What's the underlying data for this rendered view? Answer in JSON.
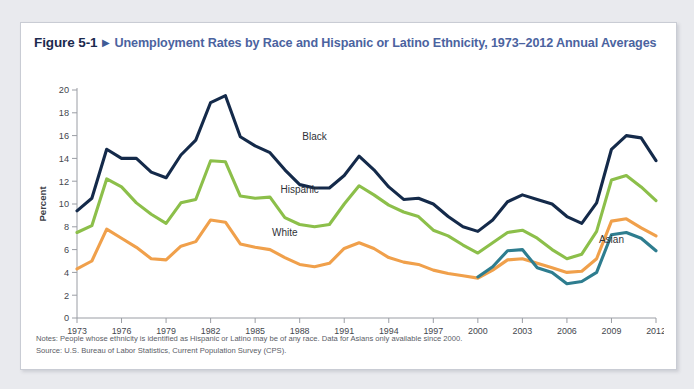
{
  "figure": {
    "number": "Figure 5-1",
    "arrow_icon": "triangle-right-icon",
    "title": "Unemployment Rates by Race and Hispanic or Latino Ethnicity, 1973–2012 Annual Averages"
  },
  "notes": {
    "note": "Notes: People whose ethnicity is identified as Hispanic or Latino may be of any race. Data for Asians only available since 2000.",
    "source": "Source: U.S. Bureau of Labor Statistics, Current Population Survey (CPS)."
  },
  "axis": {
    "ylabel": "Percent",
    "yticks": [
      "0",
      "2",
      "4",
      "6",
      "8",
      "10",
      "12",
      "14",
      "16",
      "18",
      "20"
    ],
    "xticks": [
      "1973",
      "1976",
      "1979",
      "1982",
      "1985",
      "1988",
      "1991",
      "1994",
      "1997",
      "2000",
      "2003",
      "2006",
      "2009",
      "2012"
    ]
  },
  "colors": {
    "black_series": "#142a4a",
    "hispanic_series": "#8cbf4a",
    "white_series": "#f0a04b",
    "asian_series": "#2e7d8f",
    "title_accent": "#4b63a0",
    "figure_number": "#1b2a4e",
    "axis": "#9a9da4",
    "card_bg": "#ffffff",
    "page_bg": "#e9eaee"
  },
  "chart_data": {
    "type": "line",
    "title": "Unemployment Rates by Race and Hispanic or Latino Ethnicity, 1973–2012 Annual Averages",
    "xlabel": "",
    "ylabel": "Percent",
    "xlim": [
      1973,
      2012
    ],
    "ylim": [
      0,
      20
    ],
    "grid": false,
    "legend": "inline-labels",
    "x": [
      1973,
      1974,
      1975,
      1976,
      1977,
      1978,
      1979,
      1980,
      1981,
      1982,
      1983,
      1984,
      1985,
      1986,
      1987,
      1988,
      1989,
      1990,
      1991,
      1992,
      1993,
      1994,
      1995,
      1996,
      1997,
      1998,
      1999,
      2000,
      2001,
      2002,
      2003,
      2004,
      2005,
      2006,
      2007,
      2008,
      2009,
      2010,
      2011,
      2012
    ],
    "series": [
      {
        "name": "Black",
        "color": "#142a4a",
        "label_x": 1989,
        "label_y": 15.6,
        "values": [
          9.4,
          10.5,
          14.8,
          14.0,
          14.0,
          12.8,
          12.3,
          14.3,
          15.6,
          18.9,
          19.5,
          15.9,
          15.1,
          14.5,
          13.0,
          11.7,
          11.4,
          11.4,
          12.5,
          14.2,
          13.0,
          11.5,
          10.4,
          10.5,
          10.0,
          8.9,
          8.0,
          7.6,
          8.6,
          10.2,
          10.8,
          10.4,
          10.0,
          8.9,
          8.3,
          10.1,
          14.8,
          16.0,
          15.8,
          13.8
        ]
      },
      {
        "name": "Hispanic",
        "color": "#8cbf4a",
        "label_x": 1988,
        "label_y": 11.0,
        "values": [
          7.5,
          8.1,
          12.2,
          11.5,
          10.1,
          9.1,
          8.3,
          10.1,
          10.4,
          13.8,
          13.7,
          10.7,
          10.5,
          10.6,
          8.8,
          8.2,
          8.0,
          8.2,
          10.0,
          11.6,
          10.8,
          9.9,
          9.3,
          8.9,
          7.7,
          7.2,
          6.4,
          5.7,
          6.6,
          7.5,
          7.7,
          7.0,
          6.0,
          5.2,
          5.6,
          7.6,
          12.1,
          12.5,
          11.5,
          10.3
        ]
      },
      {
        "name": "White",
        "color": "#f0a04b",
        "label_x": 1987,
        "label_y": 7.2,
        "values": [
          4.3,
          5.0,
          7.8,
          7.0,
          6.2,
          5.2,
          5.1,
          6.3,
          6.7,
          8.6,
          8.4,
          6.5,
          6.2,
          6.0,
          5.3,
          4.7,
          4.5,
          4.8,
          6.1,
          6.6,
          6.1,
          5.3,
          4.9,
          4.7,
          4.2,
          3.9,
          3.7,
          3.5,
          4.2,
          5.1,
          5.2,
          4.8,
          4.4,
          4.0,
          4.1,
          5.2,
          8.5,
          8.7,
          7.9,
          7.2
        ]
      },
      {
        "name": "Asian",
        "color": "#2e7d8f",
        "label_x": 2009,
        "label_y": 6.6,
        "start_year": 2000,
        "values": [
          null,
          null,
          null,
          null,
          null,
          null,
          null,
          null,
          null,
          null,
          null,
          null,
          null,
          null,
          null,
          null,
          null,
          null,
          null,
          null,
          null,
          null,
          null,
          null,
          null,
          null,
          null,
          3.6,
          4.5,
          5.9,
          6.0,
          4.4,
          4.0,
          3.0,
          3.2,
          4.0,
          7.3,
          7.5,
          7.0,
          5.9
        ]
      }
    ]
  }
}
